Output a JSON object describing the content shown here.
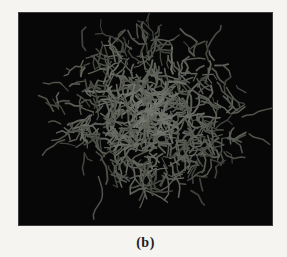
{
  "figure": {
    "caption": "(b)",
    "page_background_color": "#f5f4f0",
    "panel_background_color": "#070707",
    "stick_color_dim": "#34372f",
    "stick_color_bright": "#7e8279",
    "caption_color": "#1d1d1d",
    "molecule": {
      "seed": 1337,
      "branches": 470,
      "center_x": 133,
      "center_y": 99,
      "radius_x": 94,
      "radius_y": 85,
      "tendrils": [
        {
          "x": 80,
          "y": 165,
          "angle": 1.45,
          "steps": 9
        },
        {
          "x": 42,
          "y": 112,
          "angle": 3.3,
          "steps": 3
        },
        {
          "x": 46,
          "y": 128,
          "angle": 2.9,
          "steps": 4
        },
        {
          "x": 225,
          "y": 105,
          "angle": -0.3,
          "steps": 5
        },
        {
          "x": 232,
          "y": 122,
          "angle": 0.2,
          "steps": 4
        },
        {
          "x": 120,
          "y": 25,
          "angle": -1.6,
          "steps": 3
        }
      ]
    }
  }
}
